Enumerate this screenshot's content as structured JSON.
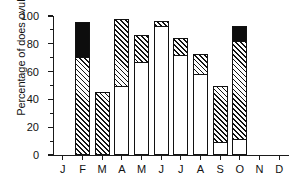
{
  "chart_data": {
    "type": "bar",
    "subtype": "stacked-bar",
    "title": "",
    "xlabel": "",
    "ylabel": "Percentage of does ovulating",
    "categories": [
      "J",
      "F",
      "M",
      "A",
      "M",
      "J",
      "J",
      "A",
      "S",
      "O",
      "N",
      "D"
    ],
    "category_names": [
      "January",
      "February",
      "March",
      "April",
      "May",
      "June",
      "July",
      "August",
      "September",
      "October",
      "November",
      "December"
    ],
    "series": [
      {
        "name": "open",
        "fill": "white",
        "cumulative_top": [
          0,
          0,
          0,
          49.5,
          67,
          92.5,
          72,
          58,
          9.5,
          11.5,
          0,
          0
        ],
        "values": [
          0,
          0,
          0,
          49.5,
          67,
          92.5,
          72,
          58,
          9.5,
          11.5,
          0,
          0
        ]
      },
      {
        "name": "hatched",
        "fill": "diagonal-hatch",
        "cumulative_top": [
          0,
          70.5,
          45,
          97.5,
          86,
          96.5,
          84,
          73,
          49.5,
          82,
          0,
          0
        ],
        "values": [
          0,
          70.5,
          45,
          48,
          19,
          4,
          12,
          15,
          40,
          70.5,
          0,
          0
        ]
      },
      {
        "name": "black",
        "fill": "solid-black",
        "cumulative_top": [
          0,
          96,
          45,
          97.5,
          86,
          96.5,
          84,
          73,
          49.5,
          92.5,
          0,
          0
        ],
        "values": [
          0,
          25.5,
          0,
          0,
          0,
          0,
          0,
          0,
          0,
          10.5,
          0,
          0
        ]
      }
    ],
    "totals": [
      0,
      96,
      45,
      97.5,
      86,
      96.5,
      84,
      73,
      49.5,
      92.5,
      0,
      0
    ],
    "ylim": [
      0,
      100
    ],
    "y_ticks": [
      0,
      20,
      40,
      60,
      80,
      100
    ],
    "y_tick_labels": [
      "0",
      "20",
      "40",
      "60",
      "80",
      "100"
    ],
    "y_minor_ticks": [
      10,
      30,
      50,
      70,
      90
    ],
    "grid": false,
    "legend": "none"
  },
  "colors": {
    "axis": "#1a1a1a",
    "black_segment": "#0d0d0d",
    "hatch_line": "#111111",
    "open_segment": "#ffffff",
    "background": "#ffffff"
  }
}
